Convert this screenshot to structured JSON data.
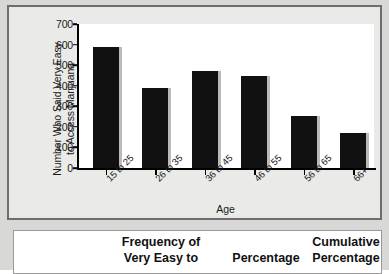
{
  "chart_data": {
    "type": "bar",
    "title": "",
    "categories": [
      "15 to 25",
      "26 to 35",
      "36 to 45",
      "46 to 55",
      "56 to 65",
      "66+"
    ],
    "values": [
      590,
      390,
      470,
      445,
      255,
      170
    ],
    "xlabel": "Age",
    "ylabel": "Number Who Said Very Easy to Access Marijuana",
    "ylabel_line1": "Number Who Said Very Easy",
    "ylabel_line2": "to Access Marijuana",
    "ylim": [
      0,
      700
    ],
    "ytick_labels": [
      "0",
      "100",
      "200",
      "300",
      "400",
      "500",
      "600",
      "700"
    ],
    "ytick_values": [
      0,
      100,
      200,
      300,
      400,
      500,
      600,
      700
    ],
    "grid": false,
    "legend": false,
    "bar_color": "#111111",
    "plot_background": "#ffffff",
    "panel_background": "#eaeae8"
  },
  "table": {
    "headers": {
      "blank": "",
      "frequency": "Frequency of\nVery Easy to",
      "percentage": "Percentage",
      "cumulative": "Cumulative\nPercentage"
    }
  }
}
